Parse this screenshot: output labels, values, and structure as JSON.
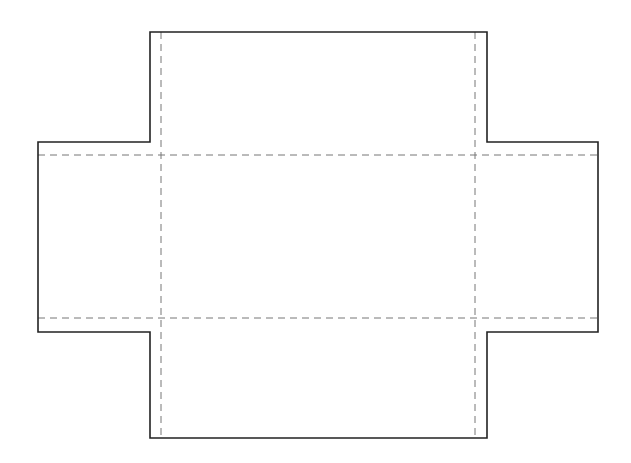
{
  "diagram": {
    "type": "box-net",
    "colors": {
      "background": "#ffffff",
      "outline": "#222222",
      "fold": "#777777"
    },
    "outline_points": [
      [
        150,
        32
      ],
      [
        487,
        32
      ],
      [
        487,
        142
      ],
      [
        598,
        142
      ],
      [
        598,
        332
      ],
      [
        487,
        332
      ],
      [
        487,
        438
      ],
      [
        150,
        438
      ],
      [
        150,
        332
      ],
      [
        38,
        332
      ],
      [
        38,
        142
      ],
      [
        150,
        142
      ]
    ],
    "fold_lines": [
      {
        "x1": 161,
        "y1": 32,
        "x2": 161,
        "y2": 438
      },
      {
        "x1": 475,
        "y1": 32,
        "x2": 475,
        "y2": 438
      },
      {
        "x1": 38,
        "y1": 155,
        "x2": 598,
        "y2": 155
      },
      {
        "x1": 38,
        "y1": 318,
        "x2": 598,
        "y2": 318
      }
    ]
  }
}
